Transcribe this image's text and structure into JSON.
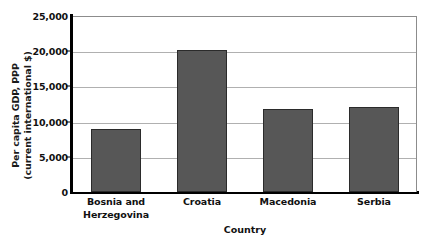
{
  "chart_data": {
    "type": "bar",
    "title": "",
    "xlabel": "Country",
    "ylabel": "Per capita GDP, PPP (current international $)",
    "ylabel_lines": [
      "Per capita GDP, PPP",
      "(current international $)"
    ],
    "categories": [
      "Bosnia and Herzegovina",
      "Croatia",
      "Macedonia",
      "Serbia"
    ],
    "category_lines": [
      [
        "Bosnia and",
        "Herzegovina"
      ],
      [
        "Croatia"
      ],
      [
        "Macedonia"
      ],
      [
        "Serbia"
      ]
    ],
    "values": [
      9000,
      20200,
      11800,
      12100
    ],
    "ylim": [
      0,
      25000
    ],
    "ytick_values": [
      0,
      5000,
      10000,
      15000,
      20000,
      25000
    ],
    "ytick_labels": [
      "0",
      "5,000",
      "10,000",
      "15,000",
      "20,000",
      "25,000"
    ],
    "grid": true,
    "legend": false,
    "colors": {
      "bar_fill": "#575757",
      "bar_border": "#2b2b2b",
      "gridline": "#b0b0b0",
      "axis": "#000000",
      "plot_background": "#ffffff",
      "text": "#111111"
    }
  }
}
